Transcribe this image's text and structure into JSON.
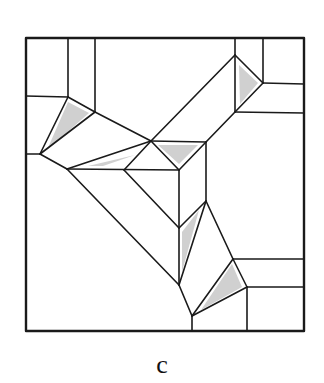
{
  "figure": {
    "caption": "c",
    "stroke_color": "#1a1a1a",
    "shade_color": "#d0d0d0",
    "background": "#ffffff",
    "frame": {
      "x1": 26,
      "y1": 38,
      "x2": 304,
      "y2": 331
    }
  }
}
